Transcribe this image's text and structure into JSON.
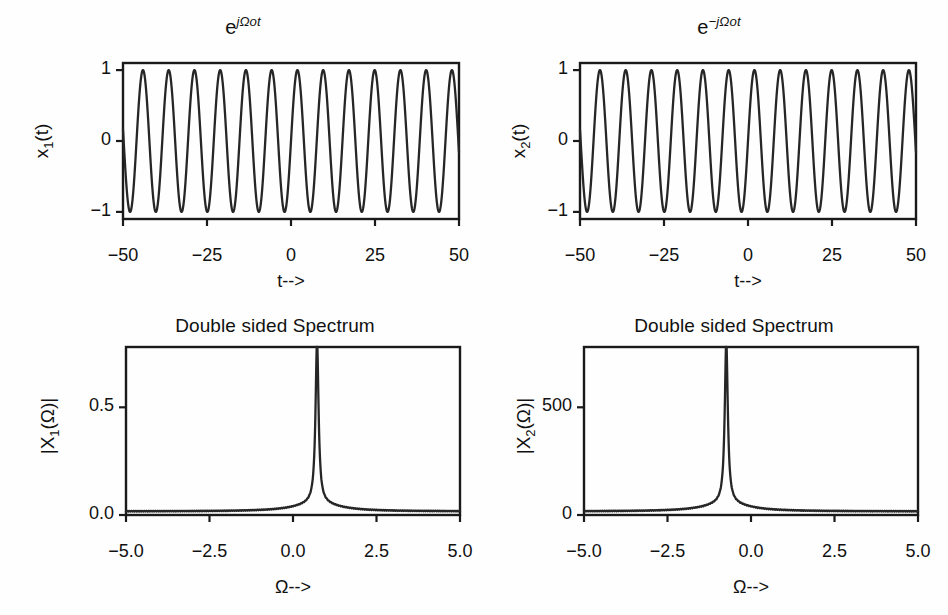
{
  "figure": {
    "width": 948,
    "height": 615,
    "background": "#fefefe",
    "ink_color": "#262626",
    "panel_count": 4
  },
  "panels": {
    "top_left": {
      "title_html": "e<sup><i>j&#937;ot</i></sup>",
      "title_text": "e^{jΩot}",
      "ylabel_html": "x<sub>1</sub>(t)",
      "ylabel_text": "x1(t)",
      "xlabel": "t-->"
    },
    "top_right": {
      "title_html": "e<sup><i>&#8722;j&#937;ot</i></sup>",
      "title_text": "e^{-jΩot}",
      "ylabel_html": "x<sub>2</sub>(t)",
      "ylabel_text": "x2(t)",
      "xlabel": "t-->"
    },
    "bottom_left": {
      "title_html": "Double sided Spectrum",
      "title_text": "Double sided Spectrum",
      "ylabel_html": "|X<sub>1</sub>(&#937;)|",
      "ylabel_text": "|X1(Ω)|",
      "xlabel": "Ω-->"
    },
    "bottom_right": {
      "title_html": "Double sided Spectrum",
      "title_text": "Double sided Spectrum",
      "ylabel_html": "|X<sub>2</sub>(&#937;)|",
      "ylabel_text": "|X2(Ω)|",
      "xlabel": "Ω-->"
    }
  },
  "chart_data": [
    {
      "id": "top_left",
      "type": "line",
      "title": "e^{jΩot}",
      "xlabel": "t-->",
      "ylabel": "x1(t)",
      "xlim": [
        -50,
        50
      ],
      "ylim": [
        -1.1,
        1.1
      ],
      "xticks": [
        -50,
        -25,
        0,
        25,
        50
      ],
      "xticklabels": [
        "−50",
        "−25",
        "0",
        "25",
        "50"
      ],
      "yticks": [
        -1,
        0,
        1
      ],
      "yticklabels": [
        "−1",
        "0",
        "1"
      ],
      "grid": false,
      "legend": null,
      "waveform": {
        "function": "sin",
        "amplitude": 1.0,
        "omega0": 0.82,
        "phase": 0.0,
        "cycles_visible": 13,
        "period": 7.66,
        "description": "Real part of exp(j*Omega0*t), sinusoid of unit amplitude"
      }
    },
    {
      "id": "top_right",
      "type": "line",
      "title": "e^{-jΩot}",
      "xlabel": "t-->",
      "ylabel": "x2(t)",
      "xlim": [
        -50,
        50
      ],
      "ylim": [
        -1.1,
        1.1
      ],
      "xticks": [
        -50,
        -25,
        0,
        25,
        50
      ],
      "xticklabels": [
        "−50",
        "−25",
        "0",
        "25",
        "50"
      ],
      "yticks": [
        -1,
        0,
        1
      ],
      "yticklabels": [
        "−1",
        "0",
        "1"
      ],
      "grid": false,
      "legend": null,
      "waveform": {
        "function": "sin",
        "amplitude": 1.0,
        "omega0": 0.82,
        "phase": 0.0,
        "cycles_visible": 13,
        "period": 7.66,
        "description": "Real part of exp(-j*Omega0*t), sinusoid of unit amplitude"
      }
    },
    {
      "id": "bottom_left",
      "type": "line",
      "title": "Double sided Spectrum",
      "xlabel": "Ω-->",
      "ylabel": "|X1(Ω)|",
      "xlim": [
        -5.0,
        5.0
      ],
      "ylim": [
        0.0,
        0.78
      ],
      "xticks": [
        -5.0,
        -2.5,
        0.0,
        2.5,
        5.0
      ],
      "xticklabels": [
        "−5.0",
        "−2.5",
        "0.0",
        "2.5",
        "5.0"
      ],
      "yticks": [
        0.0,
        0.5
      ],
      "yticklabels": [
        "0.0",
        "0.5"
      ],
      "grid": false,
      "legend": null,
      "spectrum": {
        "peak_position": 0.72,
        "peak_value": 0.75,
        "peak_halfwidth": 0.055,
        "baseline": 0.012,
        "ripple_amplitude": 0.006,
        "ripple_period": 0.13,
        "shoulder_scale": 0.055,
        "description": "Single spectral line at positive Omega0"
      }
    },
    {
      "id": "bottom_right",
      "type": "line",
      "title": "Double sided Spectrum",
      "xlabel": "Ω-->",
      "ylabel": "|X2(Ω)|",
      "xlim": [
        -5.0,
        5.0
      ],
      "ylim": [
        0.0,
        780
      ],
      "xticks": [
        -5.0,
        -2.5,
        0.0,
        2.5,
        5.0
      ],
      "xticklabels": [
        "−5.0",
        "−2.5",
        "0.0",
        "2.5",
        "5.0"
      ],
      "yticks": [
        0,
        500
      ],
      "yticklabels": [
        "0",
        "500"
      ],
      "grid": false,
      "legend": null,
      "spectrum": {
        "peak_position": -0.74,
        "peak_value": 750,
        "peak_halfwidth": 0.055,
        "baseline": 12,
        "ripple_amplitude": 6,
        "ripple_period": 0.13,
        "shoulder_scale": 0.055,
        "description": "Single spectral line at negative Omega0"
      }
    }
  ]
}
